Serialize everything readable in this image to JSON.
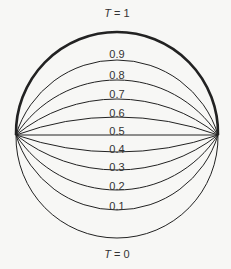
{
  "diagram": {
    "type": "isotherm-arcs",
    "endpoints": {
      "left": [
        16,
        135
      ],
      "right": [
        218,
        135
      ]
    },
    "line_color": "#222222",
    "arcs": [
      {
        "value": "1",
        "label": "T = 1",
        "apex_y": 32,
        "label_y": 13,
        "bold": true
      },
      {
        "value": "0.9",
        "label": "0.9",
        "apex_y": 60,
        "label_y": 54
      },
      {
        "value": "0.8",
        "label": "0.8",
        "apex_y": 80,
        "label_y": 75
      },
      {
        "value": "0.7",
        "label": "0.7",
        "apex_y": 99,
        "label_y": 94
      },
      {
        "value": "0.6",
        "label": "0.6",
        "apex_y": 117,
        "label_y": 113
      },
      {
        "value": "0.5",
        "label": "0.5",
        "apex_y": 135,
        "label_y": 131
      },
      {
        "value": "0.4",
        "label": "0.4",
        "apex_y": 152,
        "label_y": 149
      },
      {
        "value": "0.3",
        "label": "0.3",
        "apex_y": 170,
        "label_y": 167
      },
      {
        "value": "0.2",
        "label": "0.2",
        "apex_y": 190,
        "label_y": 186
      },
      {
        "value": "0.1",
        "label": "0.1",
        "apex_y": 210,
        "label_y": 206
      },
      {
        "value": "0",
        "label": "T = 0",
        "apex_y": 238,
        "label_y": 254
      }
    ]
  }
}
